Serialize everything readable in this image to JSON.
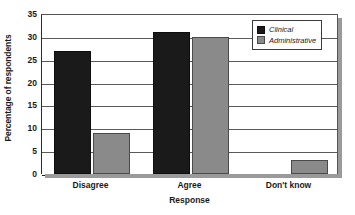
{
  "chart_data": {
    "type": "bar",
    "title": "",
    "xlabel": "Response",
    "ylabel": "Percentage of respondents",
    "categories": [
      "Disagree",
      "Agree",
      "Don't know"
    ],
    "series": [
      {
        "name": "Clinical",
        "color": "#1a1a1a",
        "values": [
          27,
          31,
          0
        ]
      },
      {
        "name": "Administrative",
        "color": "#8a8a8a",
        "values": [
          9,
          30,
          3
        ]
      }
    ],
    "ylim": [
      0,
      35
    ],
    "yticks": [
      0,
      5,
      10,
      15,
      20,
      25,
      30,
      35
    ],
    "ytick_labels": [
      "0",
      "5",
      "10",
      "15",
      "20",
      "25",
      "30",
      "35"
    ],
    "grid": true,
    "legend_position": "top-right"
  }
}
